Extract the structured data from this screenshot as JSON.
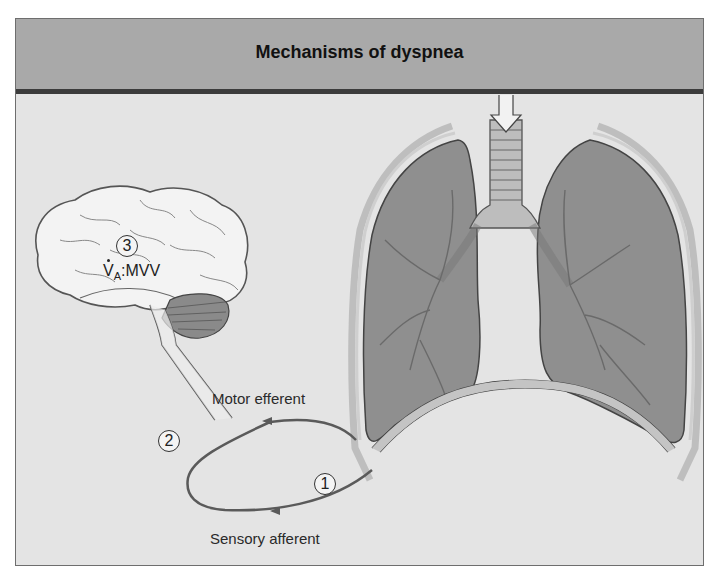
{
  "title": "Mechanisms of dyspnea",
  "brain": {
    "marker": "3",
    "ratio_label": {
      "v": "V",
      "sub": "A",
      "rest": ":MVV"
    }
  },
  "loop": {
    "marker_2": "2",
    "marker_1": "1",
    "motor_label": "Motor efferent",
    "sensory_label": "Sensory afferent"
  },
  "colors": {
    "header_bg": "#a9a9a9",
    "header_rule": "#3c3c3c",
    "panel_bg": "#e4e4e4",
    "lung_fill": "#8f8f8f",
    "loop_stroke": "#5a5a5a"
  }
}
